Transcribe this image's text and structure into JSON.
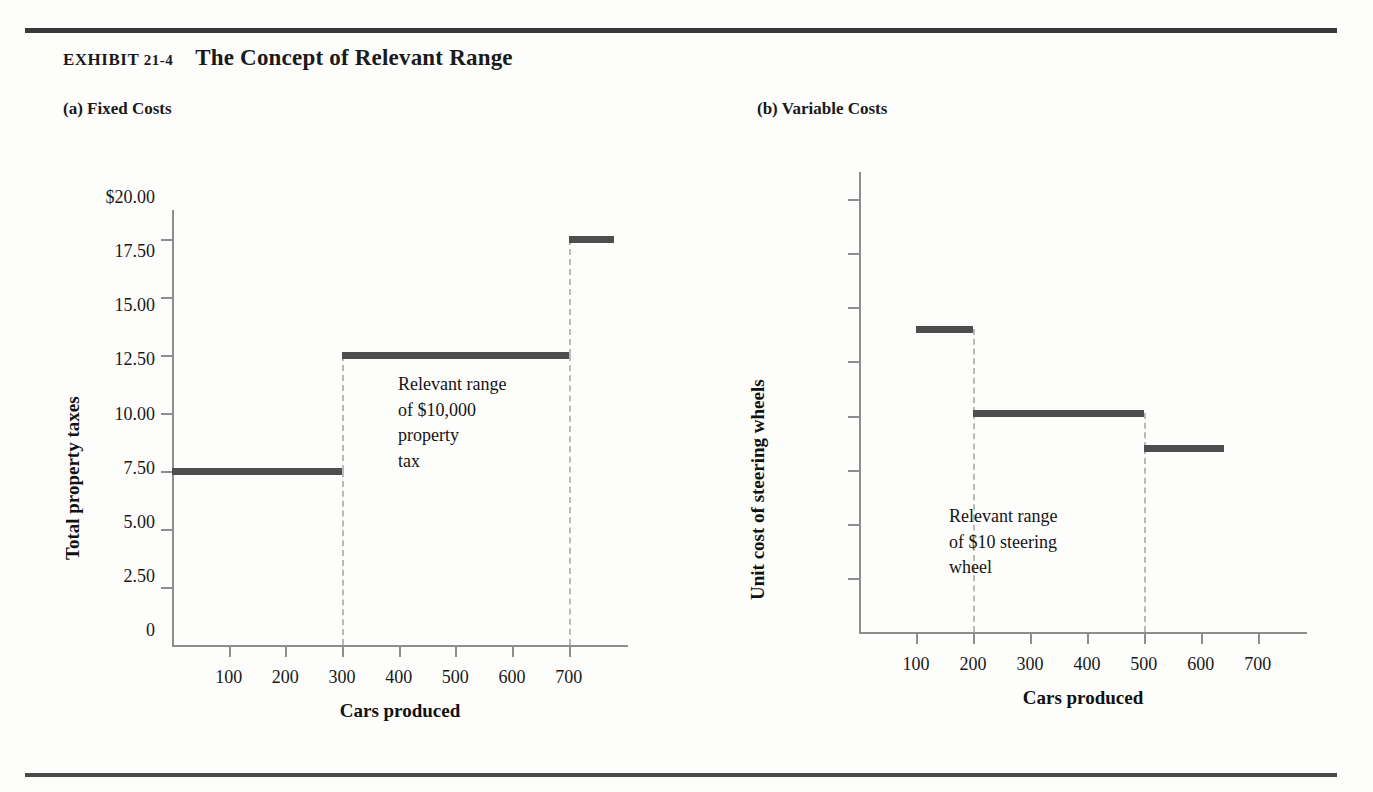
{
  "exhibit": {
    "label_prefix": "EXHIBIT",
    "label_number": "21-4",
    "title": "The Concept of Relevant Range"
  },
  "panels": {
    "a": {
      "title": "(a) Fixed Costs"
    },
    "b": {
      "title": "(b) Variable Costs"
    }
  },
  "chart_data": [
    {
      "id": "fixed-costs",
      "type": "line",
      "title": "(a) Fixed Costs",
      "xlabel": "Cars produced",
      "ylabel": "Total property taxes",
      "xlim": [
        0,
        780
      ],
      "ylim": [
        0,
        15000
      ],
      "xticks": [
        100,
        200,
        300,
        400,
        500,
        600,
        700
      ],
      "xticklabels": [
        "100",
        "200",
        "300",
        "400",
        "500",
        "600",
        "700"
      ],
      "yticks": [
        0,
        2000,
        4000,
        6000,
        8000,
        10000,
        12000,
        14000
      ],
      "yticklabels": [
        "0",
        "2,000",
        "4,000",
        "6,000",
        "8,000",
        "10,000",
        "12,000",
        "$14,000"
      ],
      "grid": false,
      "legend": false,
      "steps": [
        {
          "x_start": 0,
          "x_end": 300,
          "value": 6000
        },
        {
          "x_start": 300,
          "x_end": 700,
          "value": 10000
        },
        {
          "x_start": 700,
          "x_end": 780,
          "value": 14000
        }
      ],
      "risers_at_x": [
        300,
        700
      ],
      "annotation": "Relevant range\nof $10,000\nproperty\ntax"
    },
    {
      "id": "variable-costs",
      "type": "line",
      "title": "(b) Variable Costs",
      "xlabel": "Cars produced",
      "ylabel": "Unit cost of steering wheels",
      "xlim": [
        0,
        760
      ],
      "ylim": [
        0,
        21.25
      ],
      "xticks": [
        100,
        200,
        300,
        400,
        500,
        600,
        700
      ],
      "xticklabels": [
        "100",
        "200",
        "300",
        "400",
        "500",
        "600",
        "700"
      ],
      "yticks": [
        0,
        2.5,
        5,
        7.5,
        10,
        12.5,
        15,
        17.5,
        20
      ],
      "yticklabels": [
        "0",
        "2.50",
        "5.00",
        "7.50",
        "10.00",
        "12.50",
        "15.00",
        "17.50",
        "$20.00"
      ],
      "grid": false,
      "legend": false,
      "steps": [
        {
          "x_start": 100,
          "x_end": 200,
          "value": 14.0
        },
        {
          "x_start": 200,
          "x_end": 500,
          "value": 10.1
        },
        {
          "x_start": 500,
          "x_end": 640,
          "value": 8.5
        }
      ],
      "risers_at_x": [
        200,
        500
      ],
      "annotation": "Relevant range\nof $10 steering\nwheel"
    }
  ],
  "colors": {
    "step_line": "#4e4e4e",
    "axis": "#8e8e8e",
    "riser": "#b9b9b9",
    "rule": "#3a3a3a",
    "text": "#141414"
  }
}
